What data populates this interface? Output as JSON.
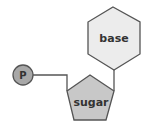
{
  "diagram": {
    "nodes": [
      {
        "id": "phosphate",
        "label": "P",
        "shape": "circle",
        "fill": "#a8a8a8"
      },
      {
        "id": "sugar",
        "label": "sugar",
        "shape": "pentagon",
        "fill": "#c8c8c8"
      },
      {
        "id": "base",
        "label": "base",
        "shape": "hexagon",
        "fill": "#ececec"
      }
    ],
    "edges": [
      {
        "from": "phosphate",
        "to": "sugar"
      },
      {
        "from": "sugar",
        "to": "base"
      }
    ],
    "colors": {
      "stroke": "#555555",
      "text": "#333333",
      "background": "#ffffff"
    }
  }
}
